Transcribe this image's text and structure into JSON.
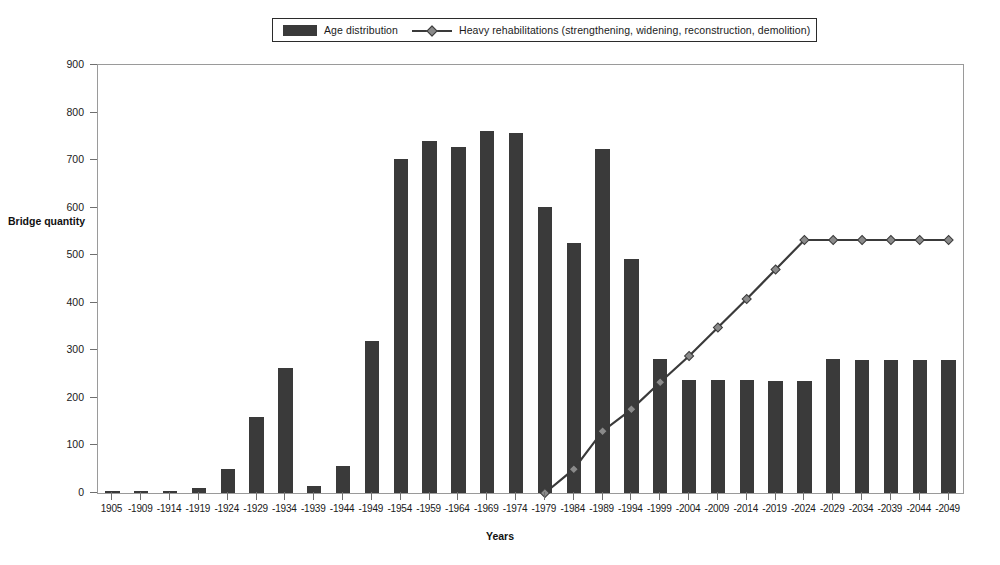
{
  "legend": {
    "items": [
      {
        "label": "Age distribution",
        "marker": "bar-swatch-icon",
        "color": "#3a3a3a"
      },
      {
        "label": "Heavy rehabilitations (strengthening, widening, reconstruction, demolition)",
        "marker": "line-diamond-icon",
        "color": "#3a3a3a"
      }
    ]
  },
  "chart_data": {
    "type": "bar",
    "title": "",
    "xlabel": "Years",
    "ylabel": "Bridge quantity",
    "ylim": [
      0,
      900
    ],
    "ytick_step": 100,
    "yticks": [
      0,
      100,
      200,
      300,
      400,
      500,
      600,
      700,
      800,
      900
    ],
    "grid": false,
    "legend_position": "top",
    "categories": [
      "1905",
      "-1909",
      "-1914",
      "-1919",
      "-1924",
      "-1929",
      "-1934",
      "-1939",
      "-1944",
      "-1949",
      "-1954",
      "-1959",
      "-1964",
      "-1969",
      "-1974",
      "-1979",
      "-1984",
      "-1989",
      "-1994",
      "-1999",
      "-2004",
      "-2009",
      "-2014",
      "-2019",
      "-2024",
      "-2029",
      "-2034",
      "-2039",
      "-2044",
      "-2049"
    ],
    "series": [
      {
        "name": "Age distribution",
        "type": "bar",
        "color": "#3a3a3a",
        "values": [
          4,
          4,
          4,
          10,
          50,
          160,
          263,
          15,
          57,
          320,
          702,
          741,
          727,
          761,
          757,
          601,
          526,
          724,
          492,
          281,
          238,
          238,
          237,
          236,
          236,
          281,
          280,
          280,
          280,
          280
        ]
      },
      {
        "name": "Heavy rehabilitations (strengthening, widening, reconstruction, demolition)",
        "type": "line",
        "color": "#3a3a3a",
        "marker_color": "#8a8a8a",
        "values": [
          null,
          null,
          null,
          null,
          null,
          null,
          null,
          null,
          null,
          null,
          null,
          null,
          null,
          null,
          null,
          0,
          50,
          130,
          176,
          233,
          288,
          348,
          408,
          470,
          532,
          532,
          532,
          532,
          532,
          532
        ]
      }
    ]
  }
}
